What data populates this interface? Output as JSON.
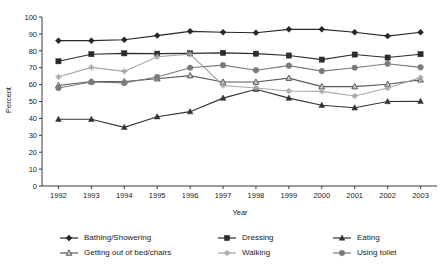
{
  "chart_data": {
    "type": "line",
    "title": "",
    "xlabel": "Year",
    "ylabel": "Percent",
    "ylim": [
      0,
      100
    ],
    "ytick_step": 10,
    "grid": false,
    "legend_position": "bottom",
    "categories": [
      "1992",
      "1993",
      "1994",
      "1995",
      "1996",
      "1997",
      "1998",
      "1999",
      "2000",
      "2001",
      "2002",
      "2003"
    ],
    "yticks": [
      "0",
      "10",
      "20",
      "30",
      "40",
      "50",
      "60",
      "70",
      "80",
      "90",
      "100"
    ],
    "series": [
      {
        "name": "Bathing/Showering",
        "marker": "diamond",
        "color": "#262626",
        "values": [
          86.0,
          86.0,
          86.5,
          89.0,
          91.5,
          91.0,
          90.7,
          92.7,
          92.7,
          91.0,
          88.7,
          91.0
        ]
      },
      {
        "name": "Dressing",
        "marker": "square",
        "color": "#2b2b2b",
        "values": [
          73.8,
          78.0,
          78.5,
          78.3,
          78.5,
          78.8,
          78.3,
          77.2,
          74.8,
          77.8,
          76.0,
          78.0
        ]
      },
      {
        "name": "Eating",
        "marker": "triangle",
        "color": "#333333",
        "values": [
          39.5,
          39.5,
          34.7,
          41.0,
          44.0,
          52.0,
          57.2,
          52.0,
          47.8,
          46.3,
          50.0,
          50.1
        ]
      },
      {
        "name": "Getting out of bed/chairs",
        "marker": "triangle-open",
        "color": "#595959",
        "values": [
          59.5,
          61.8,
          61.8,
          63.5,
          65.3,
          61.5,
          61.5,
          63.8,
          58.8,
          58.8,
          60.2,
          62.8
        ]
      },
      {
        "name": "Walking",
        "marker": "star",
        "color": "#a6a6a6",
        "values": [
          64.5,
          70.2,
          67.8,
          76.5,
          78.0,
          59.5,
          58.0,
          56.2,
          56.0,
          53.3,
          58.0,
          64.2
        ]
      },
      {
        "name": "Using toilet",
        "marker": "circle",
        "color": "#7a7a7a",
        "values": [
          58.0,
          61.5,
          61.0,
          64.5,
          70.0,
          71.5,
          68.5,
          71.2,
          68.0,
          70.0,
          72.3,
          70.2
        ]
      }
    ],
    "legend": [
      {
        "label": "Bathing/Showering",
        "marker": "diamond",
        "color": "#262626"
      },
      {
        "label": "Dressing",
        "marker": "square",
        "color": "#2b2b2b"
      },
      {
        "label": "Eating",
        "marker": "triangle",
        "color": "#333333"
      },
      {
        "label": "Getting out of bed/chairs",
        "marker": "triangle-open",
        "color": "#595959"
      },
      {
        "label": "Walking",
        "marker": "star",
        "color": "#a6a6a6"
      },
      {
        "label": "Using toilet",
        "marker": "circle",
        "color": "#7a7a7a"
      }
    ]
  }
}
